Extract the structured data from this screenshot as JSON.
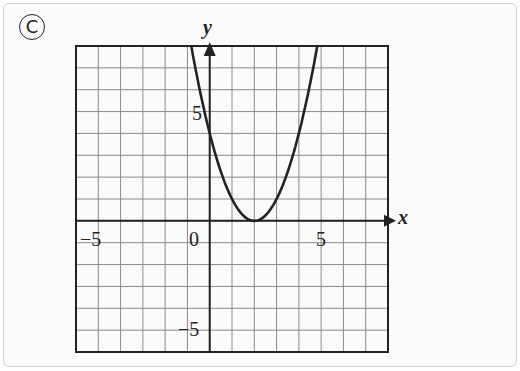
{
  "figure_label": "C",
  "chart_data": {
    "type": "line",
    "title": "",
    "xlabel": "x",
    "ylabel": "y",
    "xlim": [
      -6,
      8
    ],
    "ylim": [
      -6,
      8
    ],
    "grid": true,
    "x_tick_labels": [
      "-5",
      "0",
      "5"
    ],
    "y_tick_labels": [
      "5",
      "-5"
    ],
    "series": [
      {
        "name": "parabola",
        "equation": "y = (x - 2)^2",
        "vertex": [
          2,
          0
        ],
        "points": [
          [
            -0.83,
            8
          ],
          [
            0,
            4
          ],
          [
            1,
            1
          ],
          [
            2,
            0
          ],
          [
            3,
            1
          ],
          [
            4,
            4
          ],
          [
            4.83,
            8
          ]
        ]
      }
    ],
    "colors": {
      "curve": "#222222",
      "grid": "#8a8a8a",
      "axes": "#222222"
    }
  },
  "labels": {
    "x_axis": "x",
    "y_axis": "y",
    "tick_neg5_x": "−5",
    "tick_0": "0",
    "tick_5_x": "5",
    "tick_5_y": "5",
    "tick_neg5_y": "−5"
  }
}
